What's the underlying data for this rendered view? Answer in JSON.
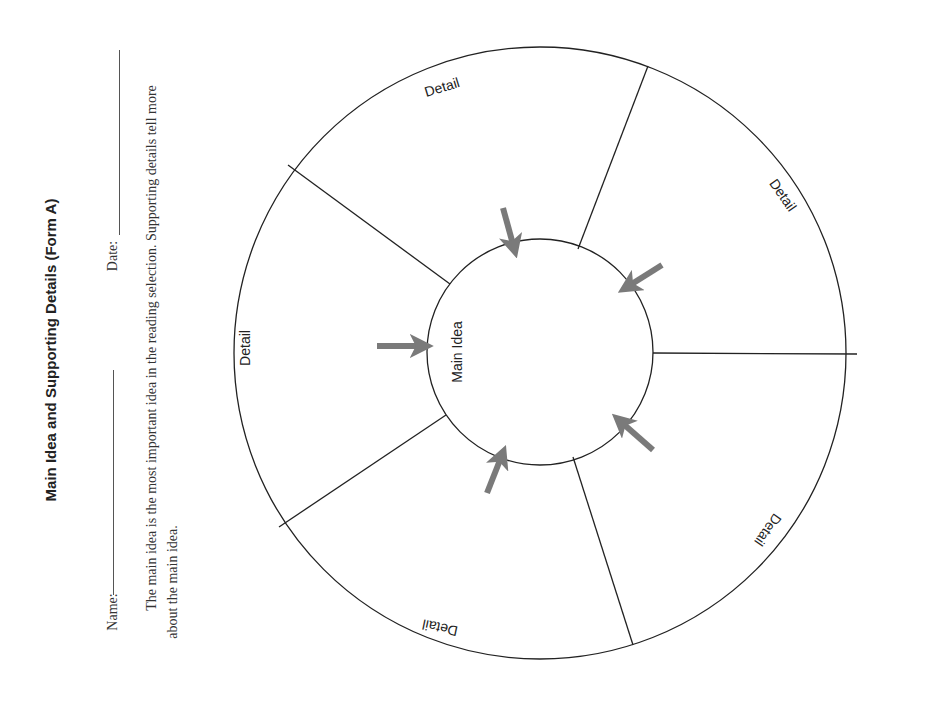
{
  "worksheet": {
    "title": "Main Idea and Supporting Details (Form A)",
    "name_label": "Name:",
    "date_label": "Date:",
    "description_line1": "The main idea is the most important idea in the reading selection. Supporting details tell more",
    "description_line2": "about the main idea."
  },
  "diagram": {
    "center_label": "Main Idea",
    "detail_labels": [
      "Detail",
      "Detail",
      "Detail",
      "Detail",
      "Detail"
    ],
    "line_color": "#222222",
    "arrow_color": "#7a7a7a",
    "arrows": 5,
    "segments": 5
  }
}
